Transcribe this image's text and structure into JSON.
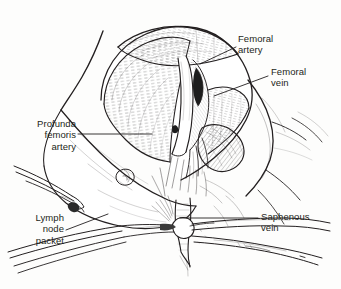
{
  "figure": {
    "style": "pen-and-ink line drawing",
    "background_color": "#fdfdfc",
    "ink_color": "#231f20"
  },
  "labels": {
    "femoral_artery": "Femoral\nartery",
    "femoral_vein": "Femoral\nvein",
    "profunda_femoris_artery": "Profunda\nfemoris\nartery",
    "lymph_node_packet": "Lymph\nnode\npacket",
    "saphenous_vein": "Saphenous\nvein"
  },
  "structures": [
    "sartorius muscle",
    "adductor longus muscle",
    "femoral artery",
    "femoral vein",
    "profunda femoris artery",
    "saphenous vein",
    "lymph node packet",
    "fascia lata edge",
    "inguinal skin flap"
  ],
  "instruments": [
    "clamp-upper-left",
    "clamp-lower-left",
    "clamp-lower-right-upper",
    "clamp-lower-right-lower"
  ]
}
